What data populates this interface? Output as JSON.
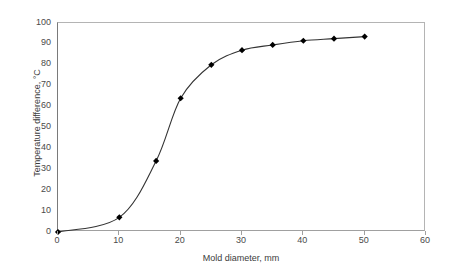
{
  "chart_data": {
    "type": "line",
    "title": "",
    "subtitle": "",
    "xlabel": "Mold diameter, mm",
    "ylabel": "Temperature difference, °C",
    "xlim": [
      0,
      60
    ],
    "ylim": [
      0,
      100
    ],
    "xticks": [
      0,
      10,
      20,
      30,
      40,
      50,
      60
    ],
    "yticks": [
      0,
      10,
      20,
      30,
      40,
      50,
      60,
      70,
      80,
      90,
      100
    ],
    "xtick_labels": [
      "0",
      "10",
      "20",
      "30",
      "40",
      "50",
      "60"
    ],
    "ytick_labels": [
      "0",
      "10",
      "20",
      "30",
      "40",
      "50",
      "60",
      "70",
      "80",
      "90",
      "100"
    ],
    "grid": false,
    "legend": null,
    "legend_position": "none",
    "marker": "filled-diamond",
    "line_color": "#333333",
    "marker_color": "#000000",
    "axis_color": "#8c8c8c",
    "background_color": "#ffffff",
    "series": [
      {
        "name": "Temperature difference",
        "x": [
          0,
          10,
          16,
          20,
          25,
          30,
          35,
          40,
          45,
          50
        ],
        "y": [
          0,
          7,
          34,
          64,
          80,
          87,
          89.5,
          91.5,
          92.5,
          93.5
        ]
      }
    ],
    "points": [
      {
        "x": 0,
        "y": 0
      },
      {
        "x": 10,
        "y": 7
      },
      {
        "x": 16,
        "y": 34
      },
      {
        "x": 20,
        "y": 64
      },
      {
        "x": 25,
        "y": 80
      },
      {
        "x": 30,
        "y": 87
      },
      {
        "x": 35,
        "y": 89.5
      },
      {
        "x": 40,
        "y": 91.5
      },
      {
        "x": 45,
        "y": 92.5
      },
      {
        "x": 50,
        "y": 93.5
      }
    ],
    "annotations": []
  }
}
